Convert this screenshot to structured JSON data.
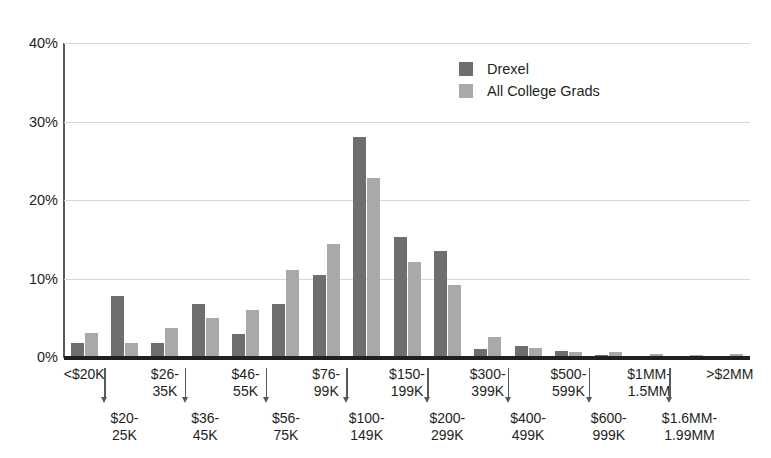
{
  "chart_data": {
    "type": "bar",
    "title": "",
    "xlabel": "",
    "ylabel": "",
    "ylim": [
      0,
      40
    ],
    "yticks": [
      "0%",
      "10%",
      "20%",
      "30%",
      "40%"
    ],
    "ytick_values": [
      0,
      10,
      20,
      30,
      40
    ],
    "grid": true,
    "legend_position": "top-right",
    "categories": [
      "<$20K",
      "$20-25K",
      "$26-35K",
      "$36-45K",
      "$46-55K",
      "$56-75K",
      "$76-99K",
      "$100-149K",
      "$150-199K",
      "$200-299K",
      "$300-399K",
      "$400-499K",
      "$500-599K",
      "$600-999K",
      "$1MM-1.5MM",
      "$1.6MM-1.99MM",
      ">$2MM"
    ],
    "category_lines": [
      [
        "<$20K"
      ],
      [
        "$20-",
        "25K"
      ],
      [
        "$26-",
        "35K"
      ],
      [
        "$36-",
        "45K"
      ],
      [
        "$46-",
        "55K"
      ],
      [
        "$56-",
        "75K"
      ],
      [
        "$76-",
        "99K"
      ],
      [
        "$100-",
        "149K"
      ],
      [
        "$150-",
        "199K"
      ],
      [
        "$200-",
        "299K"
      ],
      [
        "$300-",
        "399K"
      ],
      [
        "$400-",
        "499K"
      ],
      [
        "$500-",
        "599K"
      ],
      [
        "$600-",
        "999K"
      ],
      [
        "$1MM-",
        "1.5MM"
      ],
      [
        "$1.6MM-",
        "1.99MM"
      ],
      [
        ">$2MM"
      ]
    ],
    "series": [
      {
        "name": "Drexel",
        "color": "#6e6e6e",
        "values": [
          1.8,
          7.8,
          1.8,
          6.8,
          2.9,
          6.8,
          10.5,
          28.0,
          15.3,
          13.5,
          1.0,
          1.4,
          0.8,
          0.2,
          0.1,
          0.1,
          0.1
        ]
      },
      {
        "name": "All College Grads",
        "color": "#a9a9a9",
        "values": [
          3.0,
          1.8,
          3.7,
          5.0,
          6.0,
          11.1,
          14.4,
          22.8,
          12.1,
          9.2,
          2.6,
          1.1,
          0.7,
          0.6,
          0.35,
          0.2,
          0.4
        ]
      }
    ]
  },
  "legend": {
    "items": [
      {
        "label": "Drexel",
        "color": "#6e6e6e"
      },
      {
        "label": "All College Grads",
        "color": "#a9a9a9"
      }
    ]
  },
  "axis": {
    "y_unit": "%",
    "arrow_icon": "arrow-down-icon"
  }
}
